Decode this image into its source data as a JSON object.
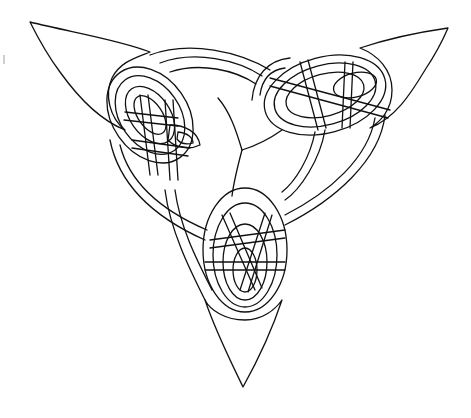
{
  "image": {
    "subject": "Celtic triquetra knot line drawing",
    "style": "black ink outline on white",
    "colors": {
      "background": "#ffffff",
      "ink": "#111111"
    }
  },
  "figure": {
    "lobes": [
      "upper-left",
      "upper-right",
      "bottom"
    ],
    "tips": {
      "upper_left": [
        30,
        22
      ],
      "upper_right": [
        448,
        28
      ],
      "bottom": [
        243,
        387
      ]
    },
    "center_hub": [
      242,
      150
    ]
  }
}
